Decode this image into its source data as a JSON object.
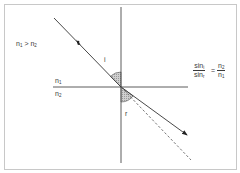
{
  "diagram": {
    "colors": {
      "frame": "#c8c8c8",
      "line": "#4a4a4a",
      "ray": "#333333",
      "angle_fill": "#bdbdbd",
      "text": "#3a3a3a"
    },
    "condition": {
      "lhs": "n",
      "lhs_sub": "1",
      "op": ">",
      "rhs": "n",
      "rhs_sub": "2"
    },
    "medium_upper": {
      "symbol": "n",
      "sub": "1"
    },
    "medium_lower": {
      "symbol": "n",
      "sub": "2"
    },
    "angle_incidence_label": "i",
    "angle_refraction_label": "r",
    "formula": {
      "left_num": "sin",
      "left_num_sub": "i",
      "left_den": "sin",
      "left_den_sub": "r",
      "equals": "=",
      "right_num": "n",
      "right_num_sub": "2",
      "right_den": "n",
      "right_den_sub": "1"
    },
    "rays": {
      "incident": "incident ray with direction arrow",
      "refracted": "refracted ray with arrowhead",
      "extension": "dashed straight-line continuation of incident ray"
    }
  }
}
